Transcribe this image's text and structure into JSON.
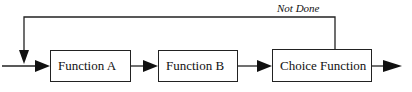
{
  "diagram": {
    "nodes": [
      {
        "id": "function-a",
        "label": "Function A"
      },
      {
        "id": "function-b",
        "label": "Function B"
      },
      {
        "id": "choice-function",
        "label": "Choice Function"
      }
    ],
    "edges": [
      {
        "from": "input",
        "to": "function-a"
      },
      {
        "from": "function-a",
        "to": "function-b"
      },
      {
        "from": "function-b",
        "to": "choice-function"
      },
      {
        "from": "choice-function",
        "to": "output"
      },
      {
        "from": "choice-function",
        "to": "function-a",
        "label": "Not Done"
      }
    ],
    "feedback_label": "Not Done"
  }
}
